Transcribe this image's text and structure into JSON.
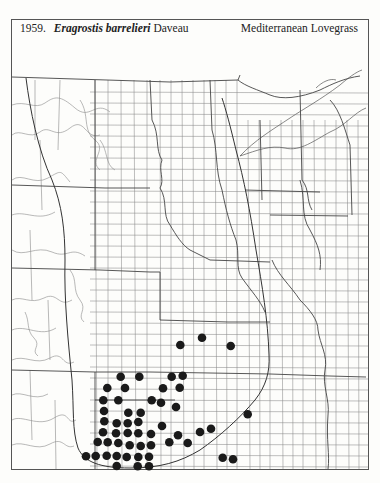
{
  "header": {
    "number": "1959.",
    "genus_species": "Eragrostis barrelieri",
    "author": "Daveau",
    "common_name": "Mediterranean Lovegrass"
  },
  "map": {
    "region": "Great Plains",
    "line_color": "#7a7a7a",
    "state_border_color": "#444444",
    "range_line_color": "#333333",
    "dot_color": "#1a1a1a",
    "dot_radius": 4.3,
    "occurrences": [
      [
        202,
        337.7
      ],
      [
        180.3,
        345
      ],
      [
        230.7,
        346
      ],
      [
        120.7,
        376.7
      ],
      [
        139.3,
        376.7
      ],
      [
        171.7,
        376.7
      ],
      [
        182.7,
        375.7
      ],
      [
        107.3,
        388
      ],
      [
        125,
        388
      ],
      [
        163,
        388.3
      ],
      [
        179.7,
        387.7
      ],
      [
        103.3,
        400.3
      ],
      [
        118.3,
        400.3
      ],
      [
        151.7,
        400.3
      ],
      [
        161,
        402.7
      ],
      [
        176,
        407
      ],
      [
        104,
        411
      ],
      [
        128.3,
        412.7
      ],
      [
        140.7,
        412.7
      ],
      [
        247.7,
        414.3
      ],
      [
        104.3,
        421.3
      ],
      [
        116.7,
        423.3
      ],
      [
        127.7,
        423.3
      ],
      [
        138.3,
        422
      ],
      [
        162,
        426
      ],
      [
        211,
        428.7
      ],
      [
        103,
        432.3
      ],
      [
        116,
        433.3
      ],
      [
        127.7,
        433
      ],
      [
        138.3,
        433.3
      ],
      [
        151,
        434
      ],
      [
        200,
        432
      ],
      [
        178,
        435.3
      ],
      [
        97.7,
        442
      ],
      [
        107.7,
        442.3
      ],
      [
        118.3,
        443
      ],
      [
        129.7,
        445.3
      ],
      [
        140.7,
        446
      ],
      [
        151,
        445.3
      ],
      [
        169.3,
        442.3
      ],
      [
        187.7,
        443
      ],
      [
        86,
        456.3
      ],
      [
        95.7,
        456
      ],
      [
        106.7,
        455.7
      ],
      [
        116.7,
        456
      ],
      [
        126.7,
        457
      ],
      [
        138.3,
        457
      ],
      [
        149,
        456.7
      ],
      [
        222.7,
        457.7
      ],
      [
        233,
        459.3
      ],
      [
        116.7,
        466
      ],
      [
        137.7,
        466.3
      ],
      [
        149,
        466.3
      ]
    ]
  }
}
